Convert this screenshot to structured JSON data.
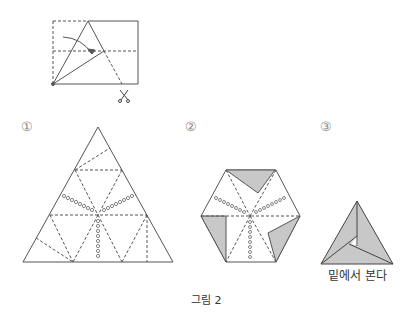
{
  "figure": {
    "caption": "그림 2",
    "step0": {
      "description": "rectangle folding diagram with cut mark"
    },
    "steps": [
      {
        "marker": "①"
      },
      {
        "marker": "②"
      },
      {
        "marker": "③",
        "note": "밑에서 본다"
      }
    ]
  },
  "colors": {
    "line": "#555555",
    "shade": "#c8c8c8"
  }
}
